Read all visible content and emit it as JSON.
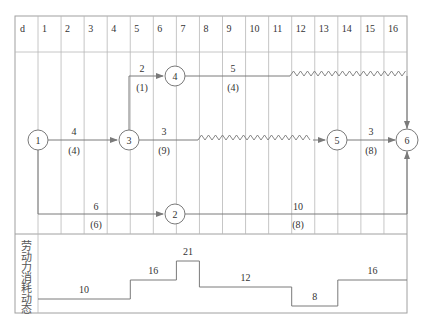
{
  "header": {
    "unit_label": "d",
    "days": [
      "1",
      "2",
      "3",
      "4",
      "5",
      "6",
      "7",
      "8",
      "9",
      "10",
      "11",
      "12",
      "13",
      "14",
      "15",
      "16"
    ]
  },
  "nodes": [
    {
      "id": "1",
      "label": "1"
    },
    {
      "id": "2",
      "label": "2"
    },
    {
      "id": "3",
      "label": "3"
    },
    {
      "id": "4",
      "label": "4"
    },
    {
      "id": "5",
      "label": "5"
    },
    {
      "id": "6",
      "label": "6"
    }
  ],
  "activities": [
    {
      "from": "1",
      "to": "3",
      "duration": "4",
      "resource": "(4)"
    },
    {
      "from": "3",
      "to": "4",
      "duration": "2",
      "resource": "(1)"
    },
    {
      "from": "4",
      "to": "6",
      "duration": "5",
      "resource": "(4)"
    },
    {
      "from": "3",
      "to": "5",
      "duration": "3",
      "resource": "(9)"
    },
    {
      "from": "5",
      "to": "6",
      "duration": "3",
      "resource": "(8)"
    },
    {
      "from": "1",
      "to": "2",
      "duration": "6",
      "resource": "(6)"
    },
    {
      "from": "2",
      "to": "6",
      "duration": "10",
      "resource": "(8)"
    }
  ],
  "labor_chart": {
    "label": "劳动力消耗动态",
    "label_chars": [
      "劳",
      "动",
      "力",
      "消",
      "耗",
      "动",
      "态"
    ],
    "steps": [
      {
        "value": "10",
        "start_day": 0,
        "end_day": 4
      },
      {
        "value": "16",
        "start_day": 4,
        "end_day": 6
      },
      {
        "value": "21",
        "start_day": 6,
        "end_day": 7
      },
      {
        "value": "12",
        "start_day": 7,
        "end_day": 11
      },
      {
        "value": "8",
        "start_day": 11,
        "end_day": 13
      },
      {
        "value": "16",
        "start_day": 13,
        "end_day": 16
      }
    ]
  }
}
